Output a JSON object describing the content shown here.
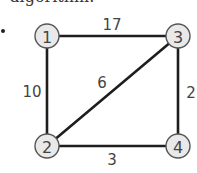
{
  "header": {
    "clipped_text": "algorithm."
  },
  "list_marker": ".",
  "graph": {
    "nodes": [
      {
        "id": "1",
        "label": "1",
        "cx": 47,
        "cy": 36
      },
      {
        "id": "2",
        "label": "2",
        "cx": 47,
        "cy": 146
      },
      {
        "id": "3",
        "label": "3",
        "cx": 178,
        "cy": 36
      },
      {
        "id": "4",
        "label": "4",
        "cx": 178,
        "cy": 146
      }
    ],
    "edges": [
      {
        "from": "1",
        "to": "3",
        "weight": "17",
        "label_x": 112,
        "label_y": 25
      },
      {
        "from": "1",
        "to": "2",
        "weight": "10",
        "label_x": 32,
        "label_y": 92
      },
      {
        "from": "2",
        "to": "3",
        "weight": "6",
        "label_x": 102,
        "label_y": 83
      },
      {
        "from": "3",
        "to": "4",
        "weight": "2",
        "label_x": 191,
        "label_y": 93
      },
      {
        "from": "2",
        "to": "4",
        "weight": "3",
        "label_x": 112,
        "label_y": 160
      }
    ],
    "colors": {
      "edge": "#1e1e1e",
      "node_fill": "#e9e9e9",
      "node_stroke": "#555555",
      "text": "#444444"
    }
  }
}
